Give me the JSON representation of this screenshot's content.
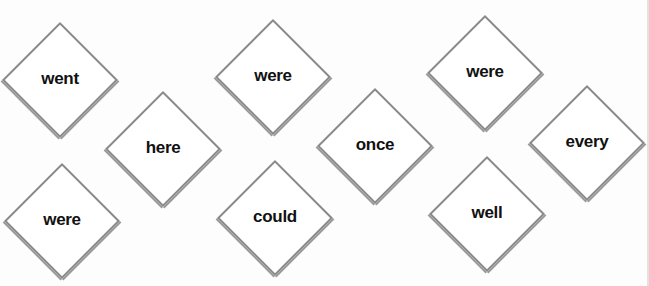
{
  "cards": [
    {
      "word": "went",
      "cx": 60,
      "cy": 80
    },
    {
      "word": "here",
      "cx": 163,
      "cy": 149
    },
    {
      "word": "were",
      "cx": 62,
      "cy": 221
    },
    {
      "word": "were",
      "cx": 273,
      "cy": 77
    },
    {
      "word": "could",
      "cx": 275,
      "cy": 218
    },
    {
      "word": "once",
      "cx": 375,
      "cy": 146
    },
    {
      "word": "were",
      "cx": 485,
      "cy": 73
    },
    {
      "word": "well",
      "cx": 487,
      "cy": 214
    },
    {
      "word": "every",
      "cx": 587,
      "cy": 143
    }
  ],
  "colors": {
    "border": "#8a8a8a",
    "text": "#111111",
    "background": "#fdfdfd"
  }
}
